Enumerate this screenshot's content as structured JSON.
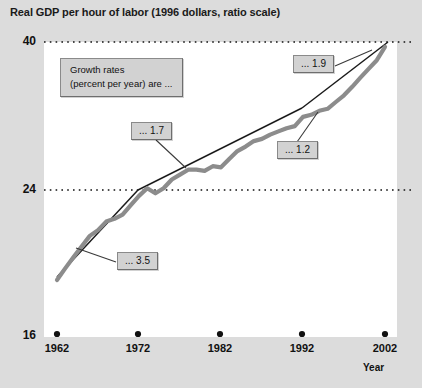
{
  "chart_data": {
    "type": "line",
    "title": "Real GDP per hour of labor (1996 dollars, ratio scale)",
    "xlabel": "Year",
    "ylabel": "",
    "scale": "ratio (logarithmic)",
    "grid": "horizontal dotted gridlines at 24 and 40",
    "legend_position": "none",
    "xlim": [
      1962,
      2002
    ],
    "ylim": [
      16,
      40
    ],
    "ytick_labels": [
      "40",
      "24",
      "16"
    ],
    "ytick_values": [
      40,
      24,
      16
    ],
    "xtick_labels": [
      "1962",
      "1972",
      "1982",
      "1992",
      "2002"
    ],
    "xtick_values": [
      1962,
      1972,
      1982,
      1992,
      2002
    ],
    "series": [
      {
        "name": "Real GDP per hour of labor",
        "style": "thick gray line",
        "color": "#8c8c8c",
        "x": [
          1962,
          1963,
          1964,
          1965,
          1966,
          1967,
          1968,
          1969,
          1970,
          1971,
          1972,
          1973,
          1974,
          1975,
          1976,
          1977,
          1978,
          1979,
          1980,
          1981,
          1982,
          1983,
          1984,
          1985,
          1986,
          1987,
          1988,
          1989,
          1990,
          1991,
          1992,
          1993,
          1994,
          1995,
          1996,
          1997,
          1998,
          1999,
          2000,
          2001,
          2002
        ],
        "values": [
          19.1,
          19.8,
          20.5,
          21.2,
          21.9,
          22.3,
          22.9,
          23.1,
          23.4,
          24.1,
          24.8,
          25.4,
          25.0,
          25.4,
          26.1,
          26.5,
          26.9,
          26.9,
          26.8,
          27.2,
          27.1,
          27.8,
          28.5,
          28.9,
          29.4,
          29.6,
          30.0,
          30.3,
          30.6,
          30.8,
          31.7,
          31.9,
          32.3,
          32.5,
          33.2,
          33.9,
          34.8,
          35.8,
          36.8,
          37.8,
          39.4
        ]
      },
      {
        "name": "Trend line 1962-1972",
        "style": "thin black straight line",
        "color": "#1a1a1a",
        "growth_rate": 3.5
      },
      {
        "name": "Trend line 1972-1992",
        "style": "thin black straight line",
        "color": "#1a1a1a",
        "growth_rate": 1.2
      },
      {
        "name": "Trend line 1992-2002",
        "style": "thin black straight line",
        "color": "#1a1a1a",
        "growth_rate": 1.9
      }
    ],
    "annotations": [
      {
        "label": "... 3.5",
        "period": "1962-1972",
        "describes": "growth rate percent per year"
      },
      {
        "label": "... 1.7",
        "period": "1972-1992 upper",
        "describes": "growth rate percent per year"
      },
      {
        "label": "... 1.2",
        "period": "1972-1992",
        "describes": "growth rate percent per year"
      },
      {
        "label": "... 1.9",
        "period": "1992-2002",
        "describes": "growth rate percent per year"
      }
    ]
  },
  "legend": {
    "line1": "Growth rates",
    "line2": "(percent per year) are ..."
  },
  "callouts": {
    "rate_35": "... 3.5",
    "rate_17": "... 1.7",
    "rate_12": "... 1.2",
    "rate_19": "... 1.9"
  },
  "axes": {
    "y_top": "40",
    "y_mid": "24",
    "y_bottom": "16",
    "x_1": "1962",
    "x_2": "1972",
    "x_3": "1982",
    "x_4": "1992",
    "x_5": "2002",
    "x_axis_title": "Year"
  },
  "colors": {
    "background": "#dcdcdc",
    "plot_background": "#ffffff",
    "data_line": "#8c8c8c",
    "trend_line": "#1a1a1a",
    "text": "#111111",
    "callout_fill": "#d2d2d2",
    "callout_border": "#8a8a8a"
  }
}
